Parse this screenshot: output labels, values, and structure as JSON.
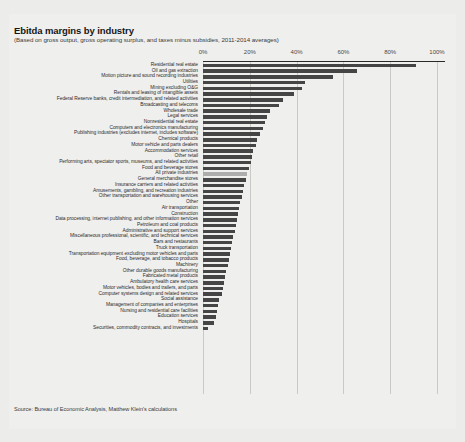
{
  "chart_data": {
    "type": "bar",
    "orientation": "horizontal",
    "title": "Ebitda margins by industry",
    "subtitle": "(Based on gross output, gross operating surplus, and taxes minus subsidies, 2011-2014 averages)",
    "source": "Source: Bureau of Economic Analysis, Matthew Klein's calculations",
    "xlabel": "",
    "ylabel": "",
    "xlim": [
      0,
      100
    ],
    "xticks": [
      0,
      20,
      40,
      60,
      80,
      100
    ],
    "xticklabels": [
      "0%",
      "20%",
      "40%",
      "60%",
      "80%",
      "100%"
    ],
    "grid": true,
    "legend": false,
    "unit": "%",
    "highlight_category": "All private industries",
    "bar_color": "#454545",
    "highlight_color": "#adadad",
    "categories": [
      "Residential real estate",
      "Oil and gas extraction",
      "Motion picture and sound recording industries",
      "Utilities",
      "Mining excluding O&G",
      "Rentals and leasing of intangible assets",
      "Federal Reserve banks, credit intermediation, and related activities",
      "Broadcasting and telecoms",
      "Wholesale trade",
      "Legal services",
      "Nonresidential real estate",
      "Computers and electronics manufacturing",
      "Publishing industries (excludes internet, includes software)",
      "Chemical products",
      "Motor vehicle and parts dealers",
      "Accommodation services",
      "Other retail",
      "Performing arts, spectator sports, museums, and related activities",
      "Food and beverage stores",
      "All private industries",
      "General merchandise stores",
      "Insurance carriers and related activities",
      "Amusements, gambling, and recreation industries",
      "Other transportation and warehousing services",
      "Other",
      "Air transportation",
      "Construction",
      "Data processing, internet publishing, and other information services",
      "Petroleum and coal products",
      "Administrative and support services",
      "Miscellaneous professional, scientific, and technical services",
      "Bars and restaurants",
      "Truck transportation",
      "Transportation equipment excluding motor vehicles and parts",
      "Food, beverage, and tobacco products",
      "Machinery",
      "Other durable goods manufacturing",
      "Fabricated metal products",
      "Ambulatory health care services",
      "Motor vehicles, bodies and trailers, and parts",
      "Computer systems design and related services",
      "Social assistance",
      "Management of companies and enterprises",
      "Nursing and residential care facilities",
      "Education services",
      "Hospitals",
      "Securities, commodity contracts, and investments"
    ],
    "values": [
      91.0,
      66.0,
      55.5,
      43.5,
      42.5,
      39.0,
      34.0,
      32.5,
      28.5,
      27.5,
      26.5,
      25.5,
      24.5,
      23.0,
      22.5,
      21.5,
      21.0,
      20.5,
      19.5,
      19.0,
      18.5,
      17.5,
      17.0,
      16.5,
      16.0,
      15.5,
      15.0,
      14.5,
      14.0,
      13.5,
      13.0,
      12.5,
      12.0,
      11.5,
      11.0,
      10.5,
      10.0,
      9.5,
      9.0,
      8.5,
      8.0,
      7.0,
      6.5,
      6.0,
      5.5,
      4.5,
      2.0
    ]
  }
}
